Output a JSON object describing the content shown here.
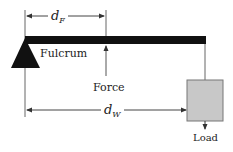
{
  "diagram": {
    "type": "lever",
    "labels": {
      "fulcrum": "Fulcrum",
      "force": "Force",
      "load": "Load",
      "d_f_main": "d",
      "d_f_sub": "F",
      "d_w_main": "d",
      "d_w_sub": "W"
    },
    "colors": {
      "beam": "#111111",
      "fulcrum": "#111111",
      "load_box": "#c8c8c8",
      "load_box_border": "#777777",
      "lines": "#555555",
      "text": "#222222"
    }
  }
}
